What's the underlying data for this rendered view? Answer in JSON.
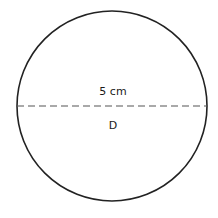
{
  "diagram": {
    "shape": "circle",
    "measurement_label": "5 cm",
    "diameter_label": "D",
    "colors": {
      "outline": "#222222",
      "diameter_line": "#555555",
      "text": "#1a1a1a",
      "background": "#ffffff"
    }
  }
}
